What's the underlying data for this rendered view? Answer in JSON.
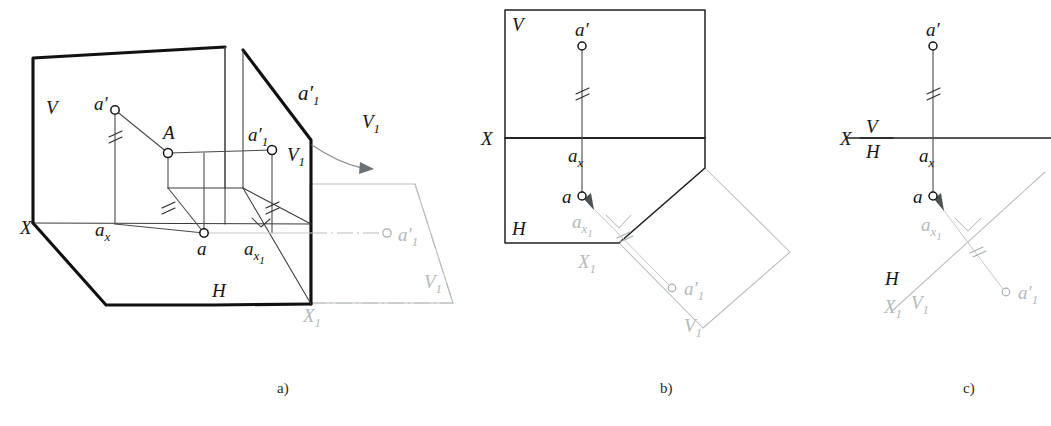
{
  "figure": {
    "background_color": "#ffffff",
    "ink_color": "#141414",
    "ghost_color": "#b5b9bc",
    "captions": [
      {
        "id": "caption-a",
        "text": "a)"
      },
      {
        "id": "caption-b",
        "text": "b)"
      },
      {
        "id": "caption-c",
        "text": "c)"
      }
    ]
  },
  "panel_a": {
    "name": "pictorial-view",
    "labels": {
      "plane_v": "V",
      "plane_h": "H",
      "axis_x": "X",
      "axis_x1": "X",
      "axis_x1_sub": "1",
      "point_A": "A",
      "point_a_frontal": "a",
      "point_a_frontal_prime": "′",
      "point_a_horizontal": "a",
      "point_ax": "a",
      "point_ax_sub": "x",
      "point_ax1": "a",
      "point_ax1_sub": "x",
      "point_ax1_sub2": "1",
      "point_a1_prime_on_plane": "a",
      "point_a1_prime_on_plane_sup": "′",
      "point_a1_prime_on_plane_sub": "1",
      "point_a1_prime_upper": "a",
      "point_a1_prime_upper_sup": "′",
      "point_a1_prime_upper_sub": "1",
      "point_a1_prime_rotated": "a",
      "point_a1_prime_rotated_sup": "′",
      "point_a1_prime_rotated_sub": "1",
      "plane_v1_edge": "V",
      "plane_v1_edge_sub": "1",
      "plane_v1_top": "V",
      "plane_v1_top_sub": "1",
      "plane_v1_rotated": "V",
      "plane_v1_rotated_sub": "1"
    }
  },
  "panel_b": {
    "name": "epure-with-planes",
    "labels": {
      "plane_v": "V",
      "plane_h": "H",
      "axis_x": "X",
      "axis_x1": "X",
      "axis_x1_sub": "1",
      "point_a_prime": "a",
      "point_a_prime_sup": "′",
      "point_a": "a",
      "point_ax": "a",
      "point_ax_sub": "x",
      "point_ax1": "a",
      "point_ax1_sub": "x",
      "point_ax1_sub2": "1",
      "point_a1_prime": "a",
      "point_a1_prime_sup": "′",
      "point_a1_prime_sub": "1",
      "plane_v1": "V",
      "plane_v1_sub": "1"
    }
  },
  "panel_c": {
    "name": "epure-axis-only",
    "labels": {
      "axis_x": "X",
      "fraction_top": "V",
      "fraction_bottom": "H",
      "point_a_prime": "a",
      "point_a_prime_sup": "′",
      "point_a": "a",
      "point_ax": "a",
      "point_ax_sub": "x",
      "point_ax1": "a",
      "point_ax1_sub": "x",
      "point_ax1_sub2": "1",
      "point_a1_prime": "a",
      "point_a1_prime_sup": "′",
      "point_a1_prime_sub": "1",
      "new_axis_h": "H",
      "new_axis_x1": "X",
      "new_axis_x1_sub": "1",
      "new_axis_v1": "V",
      "new_axis_v1_sub": "1"
    }
  }
}
